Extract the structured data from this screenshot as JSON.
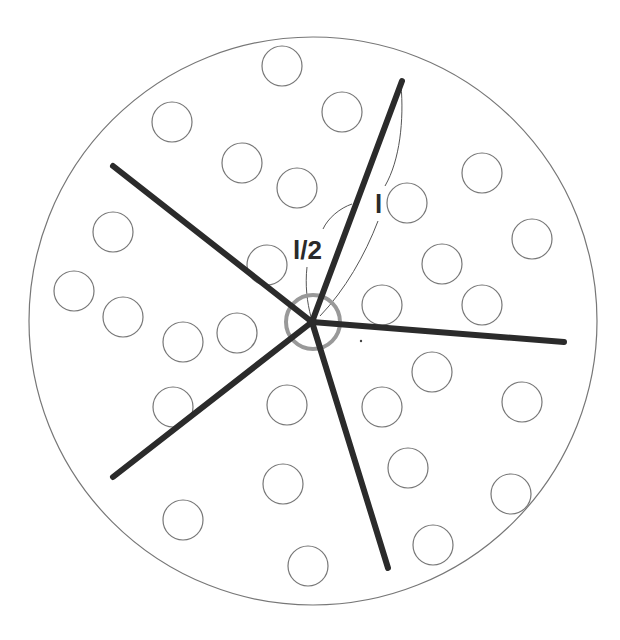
{
  "diagram": {
    "colors": {
      "background": "#ffffff",
      "outline": "#777777",
      "arm": "#2b2b2b",
      "center_ring": "#999999",
      "annotation": "#555555"
    },
    "boundary_circle": {
      "cx": 313,
      "cy": 321,
      "r": 284
    },
    "center": {
      "x": 312,
      "y": 322
    },
    "center_ring": {
      "cx": 313,
      "cy": 322,
      "r": 27
    },
    "arms": [
      {
        "id": "arm-top",
        "x2": 402,
        "y2": 81
      },
      {
        "id": "arm-right",
        "x2": 564,
        "y2": 342
      },
      {
        "id": "arm-bottom",
        "x2": 388,
        "y2": 568
      },
      {
        "id": "arm-lower-left",
        "x2": 113,
        "y2": 477
      },
      {
        "id": "arm-upper-left",
        "x2": 113,
        "y2": 166
      }
    ],
    "particle_radius": 20,
    "particles": [
      [
        282,
        66
      ],
      [
        172,
        122
      ],
      [
        342,
        112
      ],
      [
        242,
        163
      ],
      [
        297,
        188
      ],
      [
        482,
        173
      ],
      [
        407,
        203
      ],
      [
        113,
        232
      ],
      [
        532,
        239
      ],
      [
        267,
        265
      ],
      [
        442,
        264
      ],
      [
        74,
        291
      ],
      [
        123,
        317
      ],
      [
        382,
        305
      ],
      [
        482,
        305
      ],
      [
        183,
        342
      ],
      [
        237,
        333
      ],
      [
        432,
        372
      ],
      [
        173,
        407
      ],
      [
        287,
        405
      ],
      [
        382,
        407
      ],
      [
        522,
        402
      ],
      [
        408,
        468
      ],
      [
        283,
        484
      ],
      [
        511,
        494
      ],
      [
        183,
        520
      ],
      [
        433,
        545
      ],
      [
        308,
        566
      ]
    ],
    "stray_dot": {
      "x": 361,
      "y": 341
    },
    "labels": {
      "full_length": {
        "text": "l",
        "x": 375,
        "y": 213,
        "size": 26
      },
      "half_length": {
        "text": "l/2",
        "x": 293,
        "y": 259,
        "size": 26
      }
    }
  }
}
